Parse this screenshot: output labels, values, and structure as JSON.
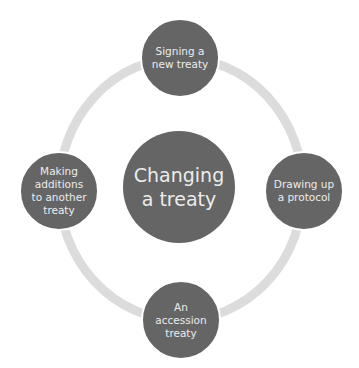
{
  "diagram": {
    "type": "radial-cycle",
    "center": {
      "label": "Changing\na treaty"
    },
    "nodes": [
      {
        "position": "top",
        "label": "Signing a\nnew treaty"
      },
      {
        "position": "right",
        "label": "Drawing up\na protocol"
      },
      {
        "position": "bottom",
        "label": "An\naccession\ntreaty"
      },
      {
        "position": "left",
        "label": "Making\nadditions\nto another\ntreaty"
      }
    ],
    "colors": {
      "node_fill": "#656565",
      "node_text": "#ececec",
      "ring": "#dcdcdc",
      "background": "#ffffff"
    }
  }
}
